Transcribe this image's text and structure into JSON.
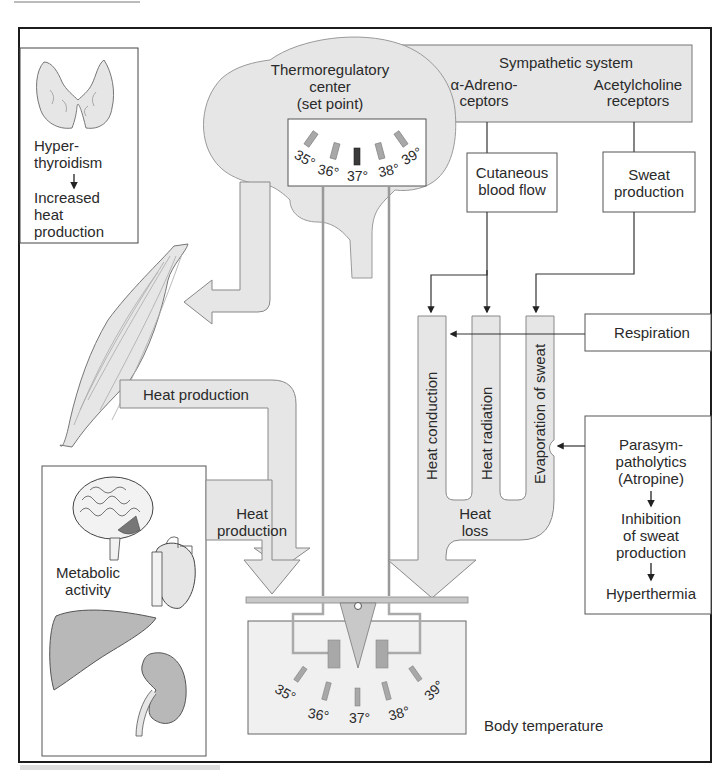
{
  "colors": {
    "fill_gray": "#e6e6e6",
    "stroke_gray": "#7a7a7a",
    "dark_bar": "#3a3a3a",
    "mid_bar": "#a8a8a8",
    "border": "#1c1c1c"
  },
  "thyroid_box": {
    "line1": "Hyper-",
    "line2": "thyroidism",
    "line3": "Increased",
    "line4": "heat",
    "line5": "production"
  },
  "thermoregulatory": {
    "line1": "Thermoregulatory",
    "line2": "center",
    "line3": "(set point)",
    "scale": [
      "35°",
      "36°",
      "37°",
      "38°",
      "39°"
    ],
    "active_index": 2
  },
  "sympathetic": {
    "title": "Sympathetic system",
    "alpha_line1": "α-Adreno-",
    "alpha_line2": "ceptors",
    "ach_line1": "Acetylcholine",
    "ach_line2": "receptors"
  },
  "cutaneous": {
    "line1": "Cutaneous",
    "line2": "blood flow"
  },
  "sweat": {
    "line1": "Sweat",
    "line2": "production"
  },
  "respiration": {
    "label": "Respiration"
  },
  "heat_loss": {
    "conduction": "Heat conduction",
    "radiation": "Heat radiation",
    "evaporation": "Evaporation of sweat",
    "line1": "Heat",
    "line2": "loss"
  },
  "parasym": {
    "line1": "Parasym-",
    "line2": "patholytics",
    "line3": "(Atropine)",
    "line4": "Inhibition",
    "line5": "of sweat",
    "line6": "production",
    "line7": "Hyperthermia"
  },
  "heat_production_upper": "Heat production",
  "heat_production_lower": {
    "line1": "Heat",
    "line2": "production"
  },
  "metabolic": {
    "line1": "Metabolic",
    "line2": "activity"
  },
  "body_temp": {
    "label": "Body temperature",
    "scale": [
      "35°",
      "36°",
      "37°",
      "38°",
      "39°"
    ]
  }
}
